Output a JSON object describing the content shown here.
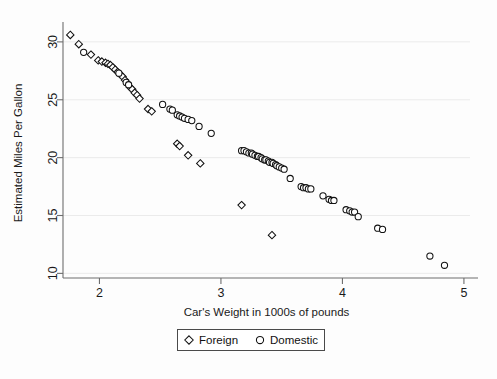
{
  "chart_data": {
    "type": "scatter",
    "title": "",
    "xlabel": "Car's Weight in 1000s of pounds",
    "ylabel": "Estimated Miles Per Gallon",
    "xlim": [
      1.7,
      5.05
    ],
    "ylim": [
      9.6,
      31.2
    ],
    "xticks": [
      "2",
      "3",
      "4",
      "5"
    ],
    "xtick_values": [
      2,
      3,
      4,
      5
    ],
    "yticks": [
      "10",
      "15",
      "20",
      "25",
      "30"
    ],
    "ytick_values": [
      10,
      15,
      20,
      25,
      30
    ],
    "grid": "horizontal-faint",
    "legend_position": "bottom-center",
    "series": [
      {
        "name": "Foreign",
        "marker": "diamond",
        "points": [
          [
            1.76,
            30.6
          ],
          [
            1.83,
            29.8
          ],
          [
            1.93,
            28.9
          ],
          [
            1.99,
            28.4
          ],
          [
            2.02,
            28.3
          ],
          [
            2.05,
            28.2
          ],
          [
            2.07,
            28.1
          ],
          [
            2.09,
            28.0
          ],
          [
            2.11,
            27.8
          ],
          [
            2.13,
            27.6
          ],
          [
            2.15,
            27.4
          ],
          [
            2.17,
            27.2
          ],
          [
            2.19,
            27.0
          ],
          [
            2.21,
            26.7
          ],
          [
            2.23,
            26.4
          ],
          [
            2.25,
            26.1
          ],
          [
            2.27,
            25.9
          ],
          [
            2.29,
            25.6
          ],
          [
            2.31,
            25.4
          ],
          [
            2.33,
            25.1
          ],
          [
            2.4,
            24.2
          ],
          [
            2.43,
            24.0
          ],
          [
            2.64,
            21.2
          ],
          [
            2.66,
            21.0
          ],
          [
            2.73,
            20.2
          ],
          [
            2.83,
            19.5
          ],
          [
            3.17,
            15.9
          ],
          [
            3.42,
            13.3
          ]
        ]
      },
      {
        "name": "Domestic",
        "marker": "circle",
        "points": [
          [
            1.87,
            29.1
          ],
          [
            2.16,
            27.3
          ],
          [
            2.22,
            26.5
          ],
          [
            2.24,
            26.3
          ],
          [
            2.52,
            24.6
          ],
          [
            2.58,
            24.2
          ],
          [
            2.6,
            24.1
          ],
          [
            2.64,
            23.7
          ],
          [
            2.66,
            23.6
          ],
          [
            2.68,
            23.5
          ],
          [
            2.7,
            23.4
          ],
          [
            2.73,
            23.3
          ],
          [
            2.76,
            23.2
          ],
          [
            2.82,
            22.7
          ],
          [
            2.92,
            22.1
          ],
          [
            3.17,
            20.6
          ],
          [
            3.19,
            20.6
          ],
          [
            3.21,
            20.5
          ],
          [
            3.23,
            20.4
          ],
          [
            3.25,
            20.4
          ],
          [
            3.26,
            20.3
          ],
          [
            3.28,
            20.2
          ],
          [
            3.3,
            20.1
          ],
          [
            3.31,
            20.1
          ],
          [
            3.33,
            20.0
          ],
          [
            3.34,
            19.9
          ],
          [
            3.36,
            19.8
          ],
          [
            3.37,
            19.8
          ],
          [
            3.39,
            19.7
          ],
          [
            3.4,
            19.6
          ],
          [
            3.42,
            19.6
          ],
          [
            3.43,
            19.5
          ],
          [
            3.45,
            19.4
          ],
          [
            3.46,
            19.3
          ],
          [
            3.48,
            19.2
          ],
          [
            3.5,
            19.1
          ],
          [
            3.52,
            19.0
          ],
          [
            3.57,
            18.2
          ],
          [
            3.66,
            17.5
          ],
          [
            3.68,
            17.4
          ],
          [
            3.7,
            17.4
          ],
          [
            3.72,
            17.3
          ],
          [
            3.74,
            17.3
          ],
          [
            3.84,
            16.7
          ],
          [
            3.89,
            16.4
          ],
          [
            3.91,
            16.3
          ],
          [
            3.93,
            16.3
          ],
          [
            4.03,
            15.5
          ],
          [
            4.06,
            15.4
          ],
          [
            4.08,
            15.3
          ],
          [
            4.1,
            15.3
          ],
          [
            4.13,
            14.9
          ],
          [
            4.29,
            13.9
          ],
          [
            4.33,
            13.8
          ],
          [
            4.72,
            11.5
          ],
          [
            4.84,
            10.7
          ]
        ]
      }
    ]
  },
  "legend": {
    "items": [
      {
        "label": "Foreign",
        "marker": "diamond"
      },
      {
        "label": "Domestic",
        "marker": "circle"
      }
    ]
  },
  "axes": {
    "x_title": "Car's Weight in 1000s of pounds",
    "y_title": "Estimated Miles Per Gallon"
  }
}
